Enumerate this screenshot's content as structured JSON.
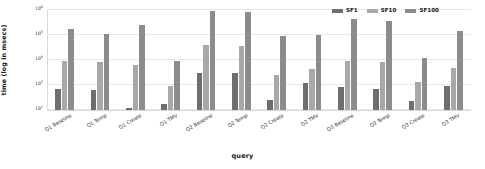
{
  "chart_data": {
    "type": "bar",
    "title": "",
    "xlabel": "query",
    "ylabel": "time (log in msecs)",
    "yscale": "log",
    "ylim": [
      100,
      1000000
    ],
    "ytick_labels": [
      "10²",
      "10³",
      "10⁴",
      "10⁵",
      "10⁶"
    ],
    "ytick_values": [
      100,
      1000,
      10000,
      100000,
      1000000
    ],
    "ytick_mantissa": [
      "10",
      "10",
      "10",
      "10",
      "10"
    ],
    "ytick_exponent": [
      "2",
      "3",
      "4",
      "5",
      "6"
    ],
    "grid": true,
    "legend_position": "top-right",
    "categories": [
      "Q1 Baseline",
      "Q1 Temp",
      "Q1 Create",
      "Q1 TMV",
      "Q2 Baseline",
      "Q2 Temp",
      "Q2 Create",
      "Q2 TMV",
      "Q3 Baseline",
      "Q3 Temp",
      "Q3 Create",
      "Q3 TMV"
    ],
    "series": [
      {
        "name": "SF1",
        "color": "#6e6e6e",
        "values": [
          700,
          620,
          120,
          180,
          3000,
          2900,
          250,
          1200,
          850,
          700,
          220,
          900
        ]
      },
      {
        "name": "SF10",
        "color": "#a8a8a8",
        "values": [
          9000,
          8000,
          6500,
          900,
          40000,
          35000,
          2500,
          4500,
          9000,
          8500,
          1300,
          5000
        ]
      },
      {
        "name": "SF100",
        "color": "#8c8c8c",
        "values": [
          180000,
          110000,
          260000,
          9500,
          900000,
          800000,
          90000,
          100000,
          420000,
          380000,
          12000,
          140000
        ]
      }
    ]
  },
  "legend": {
    "items": [
      {
        "label": "SF1",
        "color": "#6e6e6e"
      },
      {
        "label": "SF10",
        "color": "#a8a8a8"
      },
      {
        "label": "SF100",
        "color": "#8c8c8c"
      }
    ]
  }
}
